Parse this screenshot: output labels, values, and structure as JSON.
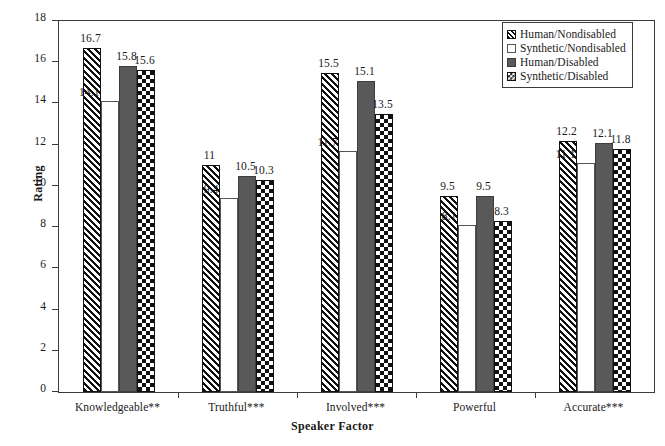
{
  "chart_data": {
    "type": "bar",
    "title": "",
    "xlabel": "Speaker Factor",
    "ylabel": "Rating",
    "ylim": [
      0,
      18
    ],
    "ytick_step": 2,
    "yticks": [
      18,
      16,
      14,
      12,
      10,
      8,
      6,
      4,
      2,
      0
    ],
    "grid": false,
    "legend_position": "top-right",
    "categories": [
      "Knowledgeable**",
      "Truthful***",
      "Involved***",
      "Powerful",
      "Accurate***"
    ],
    "series": [
      {
        "name": "Human/Nondisabled",
        "pattern": "diagonal-hatch",
        "values": [
          16.7,
          11,
          15.5,
          9.5,
          12.2
        ],
        "labels": [
          "16.7",
          "11",
          "15.5",
          "9.5",
          "12.2"
        ]
      },
      {
        "name": "Synthetic/Nondisabled",
        "pattern": "open-white",
        "values": [
          14.1,
          9.4,
          11.7,
          8.1,
          11.1
        ],
        "labels": [
          "14.1",
          "9.4",
          "11.7",
          "8.1",
          "11.1"
        ]
      },
      {
        "name": "Human/Disabled",
        "pattern": "solid-gray",
        "values": [
          15.8,
          10.5,
          15.1,
          9.5,
          12.1
        ],
        "labels": [
          "15.8",
          "10.5",
          "15.1",
          "9.5",
          "12.1"
        ]
      },
      {
        "name": "Synthetic/Disabled",
        "pattern": "checkerboard",
        "values": [
          15.6,
          10.3,
          13.5,
          8.3,
          11.8
        ],
        "labels": [
          "15.6",
          "10.3",
          "13.5",
          "8.3",
          "11.8"
        ]
      }
    ],
    "colors": {
      "hatch_fill": "#111111",
      "open_fill": "#ffffff",
      "solid_fill": "#595959",
      "check_fill": "#111111",
      "axis": "#3a3a3a",
      "text": "#1a1a1a"
    }
  },
  "legend": {
    "entries": [
      {
        "label": "Human/Nondisabled"
      },
      {
        "label": "Synthetic/Nondisabled"
      },
      {
        "label": "Human/Disabled"
      },
      {
        "label": "Synthetic/Disabled"
      }
    ]
  },
  "axes": {
    "y_title": "Rating",
    "x_title": "Speaker Factor"
  },
  "caption": {
    "text": ""
  }
}
